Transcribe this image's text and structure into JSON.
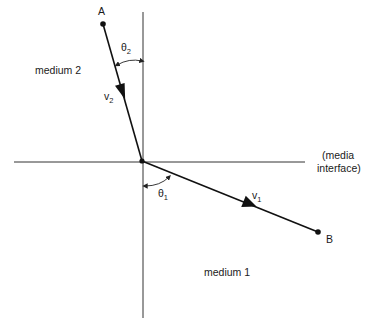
{
  "diagram": {
    "type": "refraction",
    "points": {
      "A": {
        "label": "A",
        "x": 103,
        "y": 24
      },
      "B": {
        "label": "B",
        "x": 318,
        "y": 232
      },
      "origin": {
        "x": 142,
        "y": 161
      }
    },
    "labels": {
      "medium_top": "medium 2",
      "medium_bottom": "medium 1",
      "interface_line1": "(media",
      "interface_line2": "interface)",
      "v_top": "v",
      "v_top_sub": "2",
      "v_bottom": "v",
      "v_bottom_sub": "1",
      "theta_top": "θ",
      "theta_top_sub": "2",
      "theta_bottom": "θ",
      "theta_bottom_sub": "1",
      "point_a": "A",
      "point_b": "B"
    },
    "colors": {
      "line": "#111111",
      "axis": "#333333",
      "background": "#ffffff"
    }
  }
}
